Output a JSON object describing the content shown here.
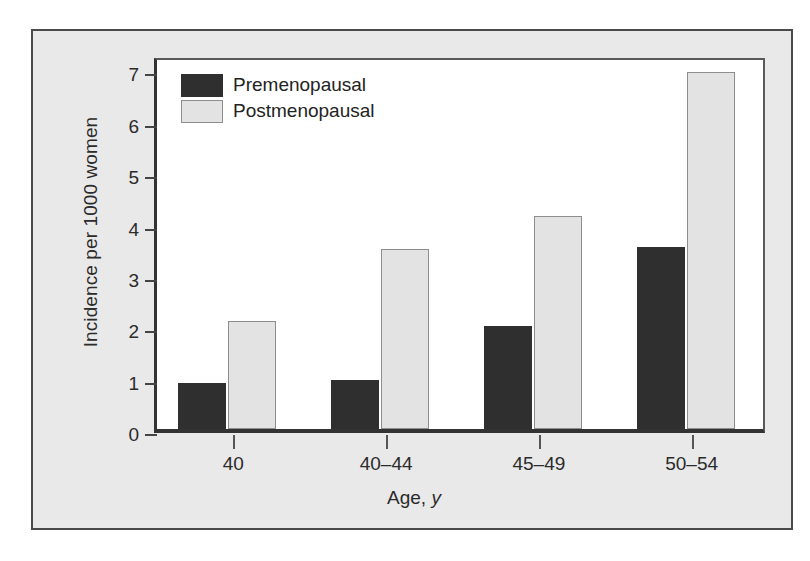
{
  "chart_data": {
    "type": "bar",
    "title": "",
    "xlabel": "Age, y",
    "ylabel": "Incidence per 1000 women",
    "categories": [
      "40",
      "40–44",
      "45–49",
      "50–54"
    ],
    "series": [
      {
        "name": "Premenopausal",
        "color": "#302f2f",
        "values": [
          0.9,
          0.95,
          2.0,
          3.55
        ]
      },
      {
        "name": "Postmenopausal",
        "color": "#e3e3e3",
        "values": [
          2.1,
          3.5,
          4.15,
          6.95
        ]
      }
    ],
    "ylim": [
      0,
      7.3
    ],
    "yticks": [
      0,
      1,
      2,
      3,
      4,
      5,
      6,
      7
    ],
    "ytick_labels": [
      "0",
      "1",
      "2",
      "3",
      "4",
      "5",
      "6",
      "7"
    ],
    "grid": false,
    "legend_position": "top-left"
  },
  "figure": {
    "background_color": "#e9e9e9",
    "plot_background_color": "#ffffff",
    "frame_color": "#4a4a4a"
  }
}
